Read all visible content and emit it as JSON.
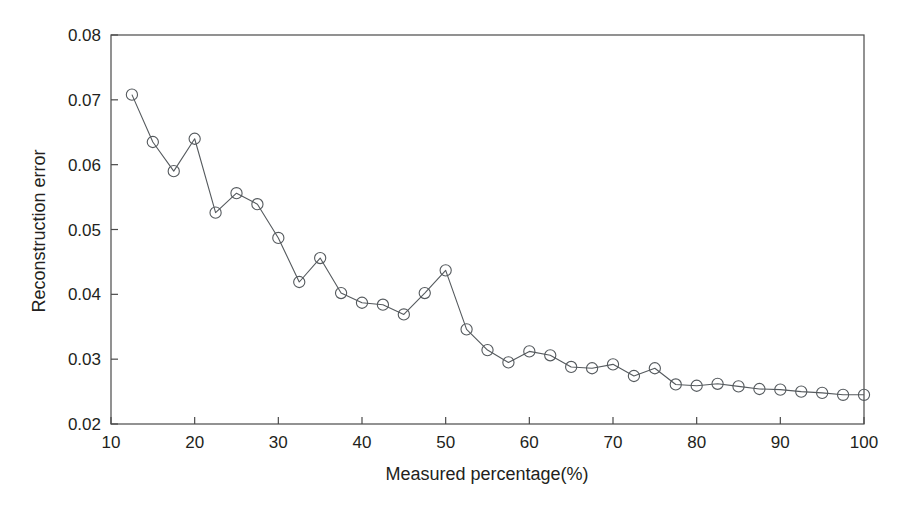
{
  "chart_data": {
    "type": "line",
    "title": "",
    "subtitle": "",
    "xlabel": "Measured percentage(%)",
    "ylabel": "Reconstruction error",
    "xlim": [
      10,
      100
    ],
    "ylim": [
      0.02,
      0.08
    ],
    "xticks": [
      10,
      20,
      30,
      40,
      50,
      60,
      70,
      80,
      90,
      100
    ],
    "xticklabels": [
      "10",
      "20",
      "30",
      "40",
      "50",
      "60",
      "70",
      "80",
      "90",
      "100"
    ],
    "yticks": [
      0.02,
      0.03,
      0.04,
      0.05,
      0.06,
      0.07,
      0.08
    ],
    "yticklabels": [
      "0.02",
      "0.03",
      "0.04",
      "0.05",
      "0.06",
      "0.07",
      "0.08"
    ],
    "grid": false,
    "legend": false,
    "legend_position": "none",
    "marker": "circle-open",
    "line_color": "#555a5e",
    "marker_color": "#555a5e",
    "series": [
      {
        "name": "Reconstruction error",
        "x": [
          12.5,
          15,
          17.5,
          20,
          22.5,
          25,
          27.5,
          30,
          32.5,
          35,
          37.5,
          40,
          42.5,
          45,
          47.5,
          50,
          52.5,
          55,
          57.5,
          60,
          62.5,
          65,
          67.5,
          70,
          72.5,
          75,
          77.5,
          80,
          82.5,
          85,
          87.5,
          90,
          92.5,
          95,
          97.5,
          100
        ],
        "values": [
          0.0708,
          0.0635,
          0.059,
          0.064,
          0.0526,
          0.0556,
          0.0539,
          0.0487,
          0.0419,
          0.0456,
          0.0402,
          0.0387,
          0.0384,
          0.0369,
          0.0402,
          0.0437,
          0.0346,
          0.0314,
          0.0295,
          0.0312,
          0.0306,
          0.0288,
          0.0286,
          0.0292,
          0.0274,
          0.0286,
          0.0261,
          0.0259,
          0.0262,
          0.0258,
          0.0254,
          0.0253,
          0.025,
          0.0248,
          0.0245,
          0.0245
        ]
      }
    ]
  }
}
